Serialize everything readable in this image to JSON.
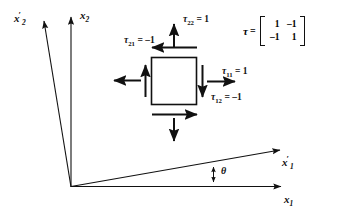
{
  "figure": {
    "type": "stress-element-rotated-axes-diagram",
    "background_color": "#ffffff",
    "line_color": "#111111"
  },
  "axes": [
    {
      "id": "x2",
      "label": "x",
      "subscript": "2",
      "primed": false,
      "orientation": "vertical",
      "description": "original vertical axis"
    },
    {
      "id": "x2p",
      "label": "x",
      "subscript": "2",
      "primed": true,
      "orientation": "tilted-left",
      "description": "rotated vertical axis"
    },
    {
      "id": "x1",
      "label": "x",
      "subscript": "1",
      "primed": false,
      "orientation": "horizontal",
      "description": "original horizontal axis"
    },
    {
      "id": "x1p",
      "label": "x",
      "subscript": "1",
      "primed": true,
      "orientation": "tilted-up",
      "description": "rotated horizontal axis"
    }
  ],
  "angle": {
    "symbol": "θ",
    "name": "theta",
    "description": "rotation angle between x1 and x1-prime axes"
  },
  "stress_labels": [
    {
      "id": "tau22",
      "tau": "τ",
      "subscript": "22",
      "equals": "=",
      "value": "1",
      "text": "τ22 = 1",
      "arrow_direction": "up",
      "position": "top"
    },
    {
      "id": "tau21",
      "tau": "τ",
      "subscript": "21",
      "equals": "=",
      "value": "–1",
      "text": "τ21 = –1",
      "arrow_direction": "left",
      "position": "top"
    },
    {
      "id": "tau11",
      "tau": "τ",
      "subscript": "11",
      "equals": "=",
      "value": "1",
      "text": "τ11 = 1",
      "arrow_direction": "right",
      "position": "right"
    },
    {
      "id": "tau12",
      "tau": "τ",
      "subscript": "12",
      "equals": "=",
      "value": "–1",
      "text": "τ12 = –1",
      "arrow_direction": "down",
      "position": "right"
    }
  ],
  "matrix": {
    "symbol": "τ",
    "equals": "=",
    "rows": [
      [
        "1",
        "–1"
      ],
      [
        "–1",
        "1"
      ]
    ]
  },
  "element": {
    "shape": "square",
    "description": "stress element square with eight traction arrows"
  }
}
